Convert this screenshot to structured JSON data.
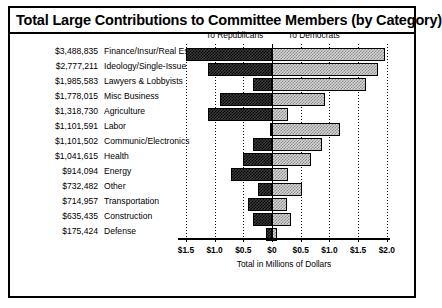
{
  "title": "Total Large Contributions to Committee Members (by Category)",
  "legend": {
    "republicans": "To Republicans",
    "democrats": "To Democrats"
  },
  "axis": {
    "xlabel": "Total in Millions of Dollars",
    "ticklabels": [
      "$1.5",
      "$1.0",
      "$0.5",
      "$0",
      "$0.5",
      "$1.0",
      "$1.5",
      "$2.0"
    ],
    "tickvalues": [
      -1.5,
      -1.0,
      -0.5,
      0,
      0.5,
      1.0,
      1.5,
      2.0
    ]
  },
  "colors": {
    "republican_fill": "#3b3b3b",
    "democrat_fill": "#d6d6d6",
    "outline": "#000000",
    "background": "#ffffff"
  },
  "rows": [
    {
      "amount": "$3,488,835",
      "category": "Finance/Insur/Real Est"
    },
    {
      "amount": "$2,777,211",
      "category": "Ideology/Single-Issue"
    },
    {
      "amount": "$1,985,583",
      "category": "Lawyers & Lobbyists"
    },
    {
      "amount": "$1,778,015",
      "category": "Misc Business"
    },
    {
      "amount": "$1,318,730",
      "category": "Agriculture"
    },
    {
      "amount": "$1,101,591",
      "category": "Labor"
    },
    {
      "amount": "$1,101,502",
      "category": "Communic/Electronics"
    },
    {
      "amount": "$1,041,615",
      "category": "Health"
    },
    {
      "amount": "$914,094",
      "category": "Energy"
    },
    {
      "amount": "$732,482",
      "category": "Other"
    },
    {
      "amount": "$714,957",
      "category": "Transportation"
    },
    {
      "amount": "$635,435",
      "category": "Construction"
    },
    {
      "amount": "$175,424",
      "category": "Defense"
    }
  ],
  "chart_data": {
    "type": "bar",
    "title": "Total Large Contributions to Committee Members (by Category)",
    "orientation": "horizontal",
    "layout": "diverging-stacked",
    "xlabel": "Total in Millions of Dollars",
    "ylabel": "",
    "xlim": [
      -1.75,
      2.15
    ],
    "xticks": [
      -1.5,
      -1.0,
      -0.5,
      0,
      0.5,
      1.0,
      1.5,
      2.0
    ],
    "xticklabels": [
      "$1.5",
      "$1.0",
      "$0.5",
      "$0",
      "$0.5",
      "$1.0",
      "$1.5",
      "$2.0"
    ],
    "grid": "vertical-dotted",
    "legend_position": "above-plot",
    "categories": [
      "Finance/Insur/Real Est",
      "Ideology/Single-Issue",
      "Lawyers & Lobbyists",
      "Misc Business",
      "Agriculture",
      "Labor",
      "Communic/Electronics",
      "Health",
      "Energy",
      "Other",
      "Transportation",
      "Construction",
      "Defense"
    ],
    "totals_labels": [
      "$3,488,835",
      "$2,777,211",
      "$1,985,583",
      "$1,778,015",
      "$1,318,730",
      "$1,101,591",
      "$1,101,502",
      "$1,041,615",
      "$914,094",
      "$732,482",
      "$714,957",
      "$635,435",
      "$175,424"
    ],
    "totals": [
      3488835,
      2777211,
      1985583,
      1778015,
      1318730,
      1101591,
      1101502,
      1041615,
      914094,
      732482,
      714957,
      635435,
      175424
    ],
    "series": [
      {
        "name": "To Republicans",
        "direction": "left",
        "units": "millions of dollars",
        "values": [
          1.5,
          1.11,
          0.33,
          0.91,
          1.12,
          0.03,
          0.33,
          0.51,
          0.72,
          0.24,
          0.42,
          0.33,
          0.1
        ]
      },
      {
        "name": "To Democrats",
        "direction": "right",
        "units": "millions of dollars",
        "values": [
          1.97,
          1.85,
          1.64,
          0.92,
          0.28,
          1.18,
          0.87,
          0.68,
          0.28,
          0.52,
          0.26,
          0.33,
          0.09
        ]
      }
    ]
  }
}
